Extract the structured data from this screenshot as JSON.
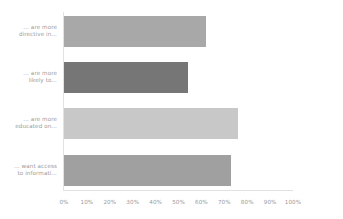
{
  "chart_data": {
    "type": "bar",
    "orientation": "horizontal",
    "title": "",
    "subtitle": "",
    "xlabel": "",
    "ylabel": "",
    "xlim": [
      0,
      100
    ],
    "grid": false,
    "legend": false,
    "legend_position": "none",
    "categories": [
      "... are more directive in...",
      "... are more likely to...",
      "... are more educated on...",
      "... want access to informati..."
    ],
    "category_lines": [
      [
        "... are more",
        "directive in..."
      ],
      [
        "... are more",
        "likely to..."
      ],
      [
        "... are more",
        "educated on..."
      ],
      [
        "... want access",
        "to informati..."
      ]
    ],
    "values": [
      62,
      54,
      76,
      73
    ],
    "value_unit": "%",
    "bar_colors": [
      "#a8a8a8",
      "#767676",
      "#c8c8c8",
      "#a0a0a0"
    ],
    "xticks": [
      0,
      10,
      20,
      30,
      40,
      50,
      60,
      70,
      80,
      90,
      100
    ],
    "xtick_labels": [
      "0%",
      "10%",
      "20%",
      "30%",
      "40%",
      "50%",
      "60%",
      "70%",
      "80%",
      "90%",
      "100%"
    ]
  },
  "style": {
    "background": "#ffffff",
    "axis_color": "#e2e2e2",
    "tick_text_color": "#9a9a9a",
    "category_text_color": "#9a9a9a"
  }
}
